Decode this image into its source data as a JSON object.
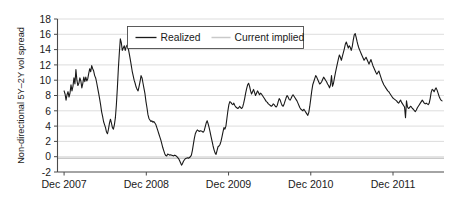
{
  "chart_data": {
    "type": "line",
    "title": "",
    "xlabel": "",
    "ylabel": "Non-directional 5Y–2Y vol spread",
    "ylim": [
      -2,
      18
    ],
    "ytick_values": [
      -2,
      0,
      2,
      4,
      6,
      8,
      10,
      12,
      14,
      16,
      18
    ],
    "ytick_labels": [
      "-2",
      "0",
      "2",
      "4",
      "6",
      "8",
      "10",
      "12",
      "14",
      "16",
      "18"
    ],
    "xtick_labels": [
      "Dec 2007",
      "Dec 2008",
      "Dec 2009",
      "Dec 2010",
      "Dec 2011"
    ],
    "xtick_positions": [
      0,
      1,
      2,
      3,
      4
    ],
    "xlim": [
      -0.08,
      4.62
    ],
    "grid": true,
    "grid_axis": "y",
    "legend": {
      "position": "top-center",
      "boxed": true,
      "entries": [
        {
          "name": "Realized",
          "color": "#1a1a1a",
          "style": "solid",
          "width": 1.2
        },
        {
          "name": "Current implied",
          "color": "#c9c9c9",
          "style": "solid",
          "width": 1.4
        }
      ]
    },
    "series": [
      {
        "name": "Realized",
        "color": "#1a1a1a",
        "x": [
          0.0,
          0.012,
          0.024,
          0.036,
          0.048,
          0.06,
          0.072,
          0.084,
          0.096,
          0.108,
          0.12,
          0.132,
          0.144,
          0.156,
          0.168,
          0.18,
          0.192,
          0.204,
          0.216,
          0.228,
          0.24,
          0.252,
          0.264,
          0.276,
          0.288,
          0.3,
          0.312,
          0.324,
          0.336,
          0.348,
          0.36,
          0.372,
          0.384,
          0.396,
          0.408,
          0.42,
          0.432,
          0.444,
          0.456,
          0.468,
          0.48,
          0.492,
          0.504,
          0.516,
          0.528,
          0.54,
          0.552,
          0.564,
          0.576,
          0.588,
          0.6,
          0.612,
          0.624,
          0.636,
          0.648,
          0.66,
          0.672,
          0.684,
          0.696,
          0.708,
          0.72,
          0.732,
          0.744,
          0.756,
          0.768,
          0.78,
          0.792,
          0.804,
          0.816,
          0.828,
          0.84,
          0.852,
          0.864,
          0.876,
          0.888,
          0.9,
          0.912,
          0.924,
          0.936,
          0.948,
          0.96,
          0.972,
          0.984,
          0.996,
          1.008,
          1.02,
          1.032,
          1.044,
          1.056,
          1.068,
          1.08,
          1.092,
          1.104,
          1.116,
          1.128,
          1.14,
          1.152,
          1.164,
          1.176,
          1.188,
          1.2,
          1.212,
          1.224,
          1.236,
          1.248,
          1.26,
          1.272,
          1.284,
          1.296,
          1.308,
          1.32,
          1.332,
          1.344,
          1.356,
          1.368,
          1.38,
          1.392,
          1.404,
          1.416,
          1.428,
          1.44,
          1.452,
          1.464,
          1.476,
          1.488,
          1.5,
          1.512,
          1.524,
          1.536,
          1.548,
          1.56,
          1.572,
          1.584,
          1.596,
          1.608,
          1.62,
          1.632,
          1.644,
          1.656,
          1.668,
          1.68,
          1.692,
          1.704,
          1.716,
          1.728,
          1.74,
          1.752,
          1.764,
          1.776,
          1.788,
          1.8,
          1.812,
          1.824,
          1.836,
          1.848,
          1.86,
          1.872,
          1.884,
          1.896,
          1.908,
          1.92,
          1.932,
          1.944,
          1.956,
          1.968,
          1.98,
          1.992,
          2.004,
          2.016,
          2.028,
          2.04,
          2.052,
          2.064,
          2.076,
          2.088,
          2.1,
          2.112,
          2.124,
          2.136,
          2.148,
          2.16,
          2.172,
          2.184,
          2.196,
          2.208,
          2.22,
          2.232,
          2.244,
          2.256,
          2.268,
          2.28,
          2.292,
          2.304,
          2.316,
          2.328,
          2.34,
          2.352,
          2.364,
          2.376,
          2.388,
          2.4,
          2.412,
          2.424,
          2.436,
          2.448,
          2.46,
          2.472,
          2.484,
          2.496,
          2.508,
          2.52,
          2.532,
          2.544,
          2.556,
          2.568,
          2.58,
          2.592,
          2.604,
          2.616,
          2.628,
          2.64,
          2.652,
          2.664,
          2.676,
          2.688,
          2.7,
          2.712,
          2.724,
          2.736,
          2.748,
          2.76,
          2.772,
          2.784,
          2.796,
          2.808,
          2.82,
          2.832,
          2.844,
          2.856,
          2.868,
          2.88,
          2.892,
          2.904,
          2.916,
          2.928,
          2.94,
          2.952,
          2.964,
          2.976,
          2.988,
          3.0,
          3.012,
          3.024,
          3.036,
          3.048,
          3.06,
          3.072,
          3.084,
          3.096,
          3.108,
          3.12,
          3.132,
          3.144,
          3.156,
          3.168,
          3.18,
          3.192,
          3.204,
          3.216,
          3.228,
          3.24,
          3.252,
          3.264,
          3.276,
          3.288,
          3.3,
          3.312,
          3.324,
          3.336,
          3.348,
          3.36,
          3.372,
          3.384,
          3.396,
          3.408,
          3.42,
          3.432,
          3.444,
          3.456,
          3.468,
          3.48,
          3.492,
          3.504,
          3.516,
          3.528,
          3.54,
          3.552,
          3.564,
          3.576,
          3.588,
          3.6,
          3.612,
          3.624,
          3.636,
          3.648,
          3.66,
          3.672,
          3.684,
          3.696,
          3.708,
          3.72,
          3.732,
          3.744,
          3.756,
          3.768,
          3.78,
          3.792,
          3.804,
          3.816,
          3.828,
          3.84,
          3.852,
          3.864,
          3.876,
          3.888,
          3.9,
          3.912,
          3.924,
          3.936,
          3.948,
          3.96,
          3.972,
          3.984,
          3.996,
          4.008,
          4.02,
          4.032,
          4.044,
          4.056,
          4.068,
          4.08,
          4.092,
          4.104,
          4.116,
          4.128,
          4.14,
          4.152,
          4.164,
          4.176,
          4.188,
          4.2,
          4.212,
          4.224,
          4.236,
          4.248,
          4.26,
          4.272,
          4.284,
          4.296,
          4.308,
          4.32,
          4.332,
          4.344,
          4.356,
          4.368,
          4.38,
          4.392,
          4.404,
          4.416,
          4.428,
          4.44,
          4.452,
          4.464,
          4.476,
          4.488,
          4.5,
          4.512,
          4.524,
          4.536,
          4.548,
          4.56,
          4.572,
          4.584,
          4.596
        ],
        "values": [
          8.6,
          8.2,
          7.4,
          8.1,
          8.5,
          7.8,
          8.3,
          9.4,
          8.6,
          9.2,
          10.3,
          9.5,
          11.4,
          10.0,
          9.3,
          9.6,
          10.3,
          9.9,
          9.0,
          9.6,
          10.4,
          9.8,
          10.4,
          9.9,
          10.2,
          10.9,
          11.5,
          11.1,
          11.9,
          11.5,
          11.2,
          10.6,
          10.3,
          9.7,
          9.0,
          8.3,
          7.6,
          6.8,
          5.9,
          5.3,
          4.6,
          4.2,
          3.8,
          3.2,
          3.0,
          3.6,
          4.4,
          4.9,
          4.4,
          3.8,
          3.6,
          4.2,
          5.1,
          6.8,
          9.0,
          11.5,
          13.6,
          15.4,
          14.9,
          13.9,
          14.2,
          14.5,
          13.9,
          14.4,
          14.6,
          14.2,
          13.5,
          12.8,
          12.0,
          11.2,
          10.6,
          10.0,
          9.6,
          9.1,
          8.8,
          8.6,
          9.2,
          9.8,
          10.6,
          10.3,
          9.6,
          8.9,
          8.2,
          7.2,
          6.4,
          5.5,
          5.0,
          4.8,
          4.6,
          4.7,
          4.5,
          4.6,
          4.4,
          4.2,
          3.8,
          3.4,
          3.0,
          2.6,
          2.2,
          1.7,
          1.2,
          0.8,
          0.4,
          0.15,
          0.1,
          0.35,
          0.3,
          0.2,
          0.25,
          0.2,
          0.15,
          0.1,
          0.2,
          0.15,
          0.05,
          -0.1,
          -0.25,
          -0.5,
          -0.8,
          -1.1,
          -0.9,
          -0.6,
          -0.4,
          -0.25,
          -0.2,
          -0.15,
          -0.2,
          -0.1,
          0.0,
          0.2,
          0.8,
          1.6,
          2.4,
          3.0,
          3.3,
          3.5,
          3.4,
          3.3,
          3.4,
          3.35,
          3.3,
          3.2,
          3.4,
          3.9,
          4.4,
          4.7,
          4.3,
          3.8,
          3.2,
          2.6,
          2.0,
          1.4,
          0.9,
          0.5,
          0.3,
          0.8,
          1.3,
          1.4,
          1.6,
          2.0,
          2.6,
          3.2,
          3.8,
          3.6,
          4.0,
          5.0,
          6.0,
          6.8,
          7.2,
          7.1,
          6.9,
          6.8,
          7.0,
          6.7,
          6.5,
          6.4,
          6.3,
          6.4,
          6.6,
          6.4,
          6.3,
          6.5,
          7.0,
          7.6,
          8.3,
          8.9,
          9.4,
          9.6,
          9.2,
          8.6,
          8.2,
          8.5,
          8.8,
          8.4,
          8.0,
          8.3,
          8.6,
          8.4,
          8.1,
          8.3,
          8.2,
          8.0,
          7.8,
          7.6,
          7.4,
          7.2,
          7.1,
          6.9,
          6.8,
          6.7,
          6.6,
          6.7,
          6.9,
          6.8,
          6.6,
          6.5,
          6.7,
          7.2,
          7.6,
          7.4,
          7.0,
          6.7,
          6.6,
          6.9,
          7.3,
          7.7,
          8.0,
          7.8,
          7.5,
          7.4,
          7.6,
          7.9,
          8.1,
          7.9,
          7.7,
          7.5,
          7.3,
          7.0,
          6.7,
          6.4,
          6.2,
          6.1,
          6.0,
          6.2,
          6.0,
          5.8,
          5.6,
          5.4,
          5.8,
          6.6,
          7.6,
          8.6,
          9.4,
          9.8,
          10.2,
          10.6,
          10.4,
          10.1,
          9.8,
          9.5,
          9.6,
          9.8,
          10.1,
          10.4,
          10.2,
          10.0,
          9.8,
          9.5,
          9.3,
          9.0,
          9.4,
          10.6,
          9.2,
          9.6,
          10.3,
          11.0,
          11.6,
          12.2,
          12.8,
          13.3,
          13.0,
          12.6,
          13.1,
          13.6,
          14.1,
          14.7,
          15.0,
          14.6,
          14.2,
          14.5,
          14.3,
          13.9,
          14.4,
          15.2,
          15.9,
          16.1,
          15.6,
          15.0,
          14.5,
          14.1,
          13.8,
          13.5,
          13.2,
          12.9,
          12.6,
          12.8,
          13.0,
          12.7,
          12.4,
          12.1,
          12.4,
          12.7,
          12.3,
          11.9,
          11.6,
          11.3,
          11.0,
          10.8,
          11.0,
          11.2,
          10.8,
          10.4,
          10.0,
          9.7,
          9.4,
          9.2,
          9.0,
          8.8,
          8.6,
          8.5,
          8.3,
          8.1,
          7.9,
          7.7,
          7.6,
          7.5,
          7.4,
          7.3,
          7.1,
          7.0,
          7.2,
          7.4,
          7.1,
          6.9,
          6.7,
          6.5,
          5.1,
          7.3,
          6.5,
          6.3,
          6.4,
          6.6,
          6.5,
          6.3,
          6.2,
          6.0,
          5.9,
          6.1,
          6.4,
          6.6,
          6.8,
          7.0,
          7.2,
          7.4,
          7.2,
          7.0,
          6.9,
          7.0,
          6.9,
          6.8,
          7.0,
          7.6,
          8.4,
          8.8,
          8.7,
          8.5,
          8.8,
          9.0,
          8.7,
          8.3,
          7.9,
          7.6,
          7.4,
          7.3
        ]
      },
      {
        "name": "Current implied",
        "color": "#c9c9c9",
        "constant_value": -0.2,
        "x": [
          -0.08,
          4.62
        ],
        "values": [
          -0.2,
          -0.2
        ]
      }
    ]
  },
  "axes": {
    "y_axis_title": "Non-directional 5Y–2Y vol spread",
    "y_ticks": [
      "18",
      "16",
      "14",
      "12",
      "10",
      "8",
      "6",
      "4",
      "2",
      "0",
      "-2"
    ],
    "x_ticks": [
      "Dec 2007",
      "Dec 2008",
      "Dec 2009",
      "Dec 2010",
      "Dec 2011"
    ]
  },
  "legend": {
    "realized_label": "Realized",
    "implied_label": "Current implied"
  },
  "colors": {
    "realized": "#1a1a1a",
    "implied": "#c9c9c9",
    "grid": "#cfcfcf",
    "axis": "#4a4a4a",
    "background": "#ffffff"
  }
}
